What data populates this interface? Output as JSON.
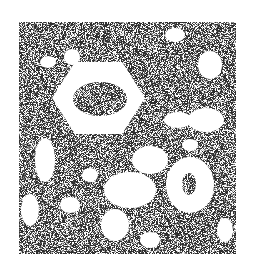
{
  "figure": {
    "panel": {
      "x": 19,
      "y": 22,
      "width": 217,
      "height": 232
    },
    "colors": {
      "background": "#ffffff",
      "dark": "#3a3a3a",
      "mid": "#7a7a7a"
    },
    "features": [
      {
        "name": "hexagon-ring",
        "cx": 98,
        "cy": 98,
        "outer_rx": 46,
        "outer_ry": 36,
        "inner_rx": 27,
        "inner_ry": 17
      },
      {
        "name": "oval-ring",
        "cx": 190,
        "cy": 185,
        "outer_rx": 23,
        "outer_ry": 27,
        "inner_rx": 7,
        "inner_ry": 11
      }
    ]
  }
}
